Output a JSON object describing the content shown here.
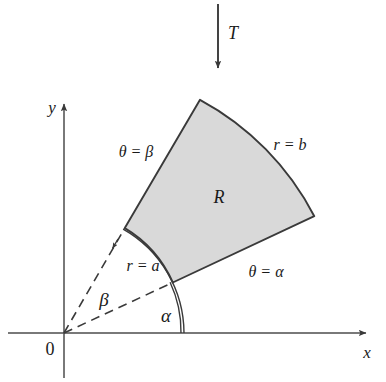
{
  "figure": {
    "title_symbol": "T",
    "axes": {
      "x_label": "x",
      "y_label": "y",
      "origin_label": "0"
    },
    "region_label": "R",
    "boundaries": {
      "inner_radius": "r = a",
      "outer_radius": "r = b",
      "lower_ray": "θ = α",
      "upper_ray": "θ = β"
    },
    "angles": {
      "alpha": "α",
      "beta": "β"
    },
    "colors": {
      "region_fill": "#d9d9d9",
      "stroke": "#333333",
      "axis": "#4d4d4d",
      "text": "#1a1a1a"
    },
    "geometry": {
      "origin_x": 64,
      "origin_y": 333,
      "inner_radius_px": 120,
      "outer_radius_px": 276,
      "alpha_deg": 24.9,
      "beta_deg": 60.4
    }
  }
}
